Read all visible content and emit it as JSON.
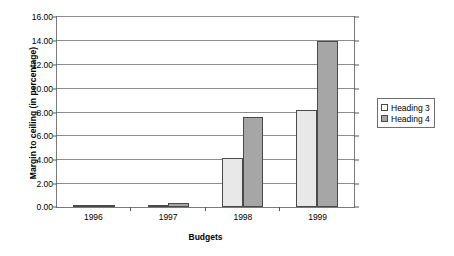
{
  "chart_data": {
    "type": "bar",
    "title": "",
    "subtitle": "",
    "xlabel": "Budgets",
    "ylabel": "Margin to ceiling (in percentage)",
    "categories": [
      "1996",
      "1997",
      "1998",
      "1999"
    ],
    "series": [
      {
        "name": "Heading 3",
        "color": "#e8e8e8",
        "values": [
          0.1,
          0.1,
          4.1,
          8.1
        ]
      },
      {
        "name": "Heading 4",
        "color": "#a6a6a6",
        "values": [
          0.1,
          0.3,
          7.5,
          13.9
        ]
      }
    ],
    "ylim": [
      0,
      16
    ],
    "ytick_step": 2,
    "ytick_labels": [
      "16.00",
      "14.00",
      "12.00",
      "10.00",
      "8.00",
      "6.00",
      "4.00",
      "2.00",
      "0.00"
    ],
    "grid": true,
    "legend_position": "right",
    "legend_entries": [
      "Heading 3",
      "Heading 4"
    ]
  }
}
